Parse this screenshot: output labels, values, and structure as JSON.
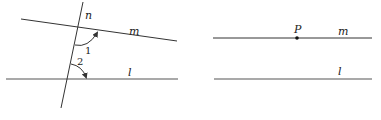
{
  "figures": [
    {
      "id": "left",
      "labels": {
        "n": "n",
        "m": "m",
        "l": "l",
        "angle1": "1",
        "angle2": "2"
      },
      "lines": {
        "m": {
          "x1": 21,
          "y1": 19,
          "x2": 177,
          "y2": 41
        },
        "l": {
          "x1": 6,
          "y1": 79,
          "x2": 178,
          "y2": 79
        },
        "n": {
          "x1": 83,
          "y1": 2,
          "x2": 61,
          "y2": 108
        }
      }
    },
    {
      "id": "right",
      "labels": {
        "P": "P",
        "m": "m",
        "l": "l"
      },
      "lines": {
        "m": {
          "x1": 213,
          "y1": 38,
          "x2": 372,
          "y2": 38
        },
        "l": {
          "x1": 214,
          "y1": 79,
          "x2": 372,
          "y2": 79
        }
      },
      "point": {
        "x": 297,
        "y": 38
      }
    }
  ],
  "colors": {
    "stroke": "#333333",
    "background": "#ffffff"
  }
}
